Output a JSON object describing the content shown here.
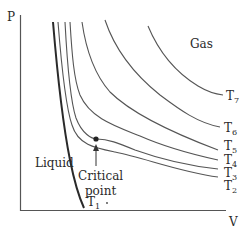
{
  "diagram": {
    "type": "PV isotherm diagram",
    "axes": {
      "y_label": "P",
      "x_label": "V"
    },
    "regions": {
      "gas": "Gas",
      "liquid": "Liquid"
    },
    "critical_point": {
      "line1": "Critical",
      "line2": "point"
    },
    "isotherms": [
      {
        "name": "T",
        "sub": "1"
      },
      {
        "name": "T",
        "sub": "2"
      },
      {
        "name": "T",
        "sub": "3"
      },
      {
        "name": "T",
        "sub": "4"
      },
      {
        "name": "T",
        "sub": "5"
      },
      {
        "name": "T",
        "sub": "6"
      },
      {
        "name": "T",
        "sub": "7"
      }
    ],
    "colors": {
      "line": "#555555",
      "thick_line": "#2a2a2a",
      "text": "#2a2a2a"
    }
  }
}
